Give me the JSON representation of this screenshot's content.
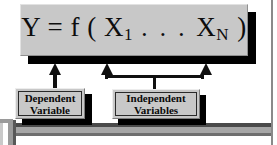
{
  "diagram": {
    "formula": {
      "lead": "Y = f ( X",
      "sub1": "1",
      "dots": ". . .",
      "var2": "X",
      "sub2": "N",
      "close": ")",
      "full_text": "Y = f ( X1 . . . XN )"
    },
    "labels": {
      "dependent": {
        "line1": "Dependent",
        "line2": "Variable"
      },
      "independent": {
        "line1": "Independent",
        "line2": "Variables"
      }
    },
    "arrows": {
      "dependent_arrow": "arrow-up",
      "independent_arrow_left": "arrow-up",
      "independent_arrow_right": "arrow-up"
    },
    "colors": {
      "box_fill": "#c8c8c8",
      "shadow": "#000000",
      "text": "#0d0d0d",
      "page_background": "#ffffff",
      "frame_gray": "#9a9a9a"
    }
  }
}
